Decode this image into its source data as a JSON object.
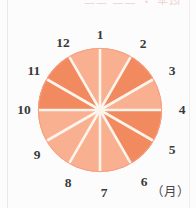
{
  "page": {
    "clipped_title": "—— —— ・ 平均",
    "background_color": "#fdfcfc"
  },
  "chart_data": {
    "type": "pie",
    "title": "",
    "subtitle": "",
    "xlabel": "",
    "ylabel": "",
    "unit_label": "（月）",
    "legend_position": "none",
    "grid": false,
    "center": {
      "x": 100,
      "y": 110
    },
    "radius": 62,
    "equal_sectors": true,
    "sector_count": 12,
    "gap_color": "#fdf4ec",
    "colors": {
      "light": "#f8b090",
      "dark": "#f28a60",
      "outline": "#f6a184"
    },
    "categories": [
      "1",
      "2",
      "3",
      "4",
      "5",
      "6",
      "7",
      "8",
      "9",
      "10",
      "11",
      "12"
    ],
    "tick_labels": [
      "1",
      "2",
      "3",
      "4",
      "5",
      "6",
      "7",
      "8",
      "9",
      "10",
      "11",
      "12"
    ],
    "values": [
      1,
      1,
      1,
      1,
      1,
      1,
      1,
      1,
      1,
      1,
      1,
      1
    ],
    "slices": [
      {
        "label": "1",
        "from_tick": "1",
        "to_tick": "2",
        "shade": "light",
        "value": 1
      },
      {
        "label": "2",
        "from_tick": "2",
        "to_tick": "3",
        "shade": "dark",
        "value": 1
      },
      {
        "label": "3",
        "from_tick": "3",
        "to_tick": "4",
        "shade": "light",
        "value": 1
      },
      {
        "label": "4",
        "from_tick": "4",
        "to_tick": "5",
        "shade": "dark",
        "value": 1
      },
      {
        "label": "5",
        "from_tick": "5",
        "to_tick": "6",
        "shade": "dark",
        "value": 1
      },
      {
        "label": "6",
        "from_tick": "6",
        "to_tick": "7",
        "shade": "light",
        "value": 1
      },
      {
        "label": "7",
        "from_tick": "7",
        "to_tick": "8",
        "shade": "light",
        "value": 1
      },
      {
        "label": "8",
        "from_tick": "8",
        "to_tick": "9",
        "shade": "light",
        "value": 1
      },
      {
        "label": "9",
        "from_tick": "9",
        "to_tick": "10",
        "shade": "light",
        "value": 1
      },
      {
        "label": "10",
        "from_tick": "10",
        "to_tick": "11",
        "shade": "dark",
        "value": 1
      },
      {
        "label": "11",
        "from_tick": "11",
        "to_tick": "12",
        "shade": "dark",
        "value": 1
      },
      {
        "label": "12",
        "from_tick": "12",
        "to_tick": "1",
        "shade": "light",
        "value": 1
      }
    ],
    "tick_positions": [
      {
        "label": "1",
        "x": 100,
        "y": 35
      },
      {
        "label": "2",
        "x": 143,
        "y": 44
      },
      {
        "label": "3",
        "x": 172,
        "y": 71
      },
      {
        "label": "4",
        "x": 182,
        "y": 110
      },
      {
        "label": "5",
        "x": 172,
        "y": 150
      },
      {
        "label": "6",
        "x": 144,
        "y": 182
      },
      {
        "label": "7",
        "x": 104,
        "y": 193
      },
      {
        "label": "8",
        "x": 68,
        "y": 183
      },
      {
        "label": "9",
        "x": 37,
        "y": 155
      },
      {
        "label": "10",
        "x": 24,
        "y": 110
      },
      {
        "label": "11",
        "x": 34,
        "y": 71
      },
      {
        "label": "12",
        "x": 63,
        "y": 43
      }
    ]
  }
}
